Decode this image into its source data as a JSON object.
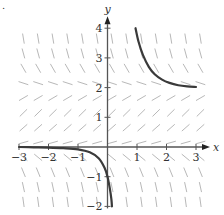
{
  "figure": {
    "type": "slope_field",
    "equation_inferred": "dy/dx = y(2 - y)",
    "corner_mark": "."
  },
  "chart_data": {
    "type": "slope_field",
    "title": "",
    "xlabel": "x",
    "ylabel": "y",
    "xlim": [
      -3,
      3
    ],
    "ylim": [
      -2,
      4
    ],
    "x_ticks": [
      -3,
      -2,
      -1,
      1,
      2,
      3
    ],
    "y_ticks": [
      -2,
      -1,
      1,
      2,
      3,
      4
    ],
    "x_tick_labels": [
      "−3",
      "−2",
      "−1",
      "1",
      "2",
      "3"
    ],
    "y_tick_labels": [
      "−2",
      "−1",
      "1",
      "2",
      "3",
      "4"
    ],
    "grid": false,
    "field": {
      "x_start": -2.85,
      "x_step": 0.5,
      "x_count": 13,
      "y_start": -1.85,
      "y_step": 0.5,
      "y_count": 12,
      "segment_length": 0.32,
      "color": "#b8b8b8"
    },
    "solution_curves": [
      {
        "name": "upper-solution",
        "color": "#3a3a3a",
        "points": [
          [
            0.95,
            4.0
          ],
          [
            1.05,
            3.55
          ],
          [
            1.2,
            3.1
          ],
          [
            1.4,
            2.7
          ],
          [
            1.6,
            2.45
          ],
          [
            1.85,
            2.27
          ],
          [
            2.1,
            2.16
          ],
          [
            2.4,
            2.08
          ],
          [
            2.7,
            2.04
          ],
          [
            3.0,
            2.02
          ]
        ]
      },
      {
        "name": "lower-solution",
        "color": "#3a3a3a",
        "points": [
          [
            -3.0,
            0.0
          ],
          [
            -2.5,
            -0.01
          ],
          [
            -2.0,
            -0.02
          ],
          [
            -1.5,
            -0.04
          ],
          [
            -1.0,
            -0.08
          ],
          [
            -0.6,
            -0.18
          ],
          [
            -0.3,
            -0.38
          ],
          [
            -0.1,
            -0.7
          ],
          [
            0.0,
            -1.0
          ],
          [
            0.08,
            -1.4
          ],
          [
            0.13,
            -1.75
          ],
          [
            0.15,
            -2.0
          ]
        ]
      }
    ]
  },
  "colors": {
    "axis": "#555555",
    "axis_arrow": "#222222",
    "curve": "#3a3a3a",
    "field": "#b8b8b8"
  }
}
